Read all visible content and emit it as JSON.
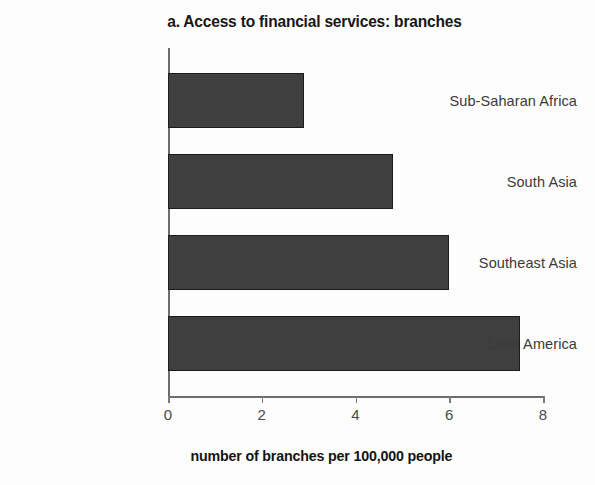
{
  "chart_data": {
    "type": "bar",
    "orientation": "horizontal",
    "title": "a. Access to financial services: branches",
    "xlabel": "number of branches per 100,000 people",
    "ylabel": "",
    "categories": [
      "Sub-Saharan Africa",
      "South Asia",
      "Southeast Asia",
      "Latin America"
    ],
    "values": [
      2.9,
      4.8,
      6.0,
      7.5
    ],
    "xlim": [
      0,
      8
    ],
    "xticks": [
      0,
      2,
      4,
      6,
      8
    ],
    "xtick_labels": [
      "0",
      "2",
      "4",
      "6",
      "8"
    ],
    "grid": false,
    "legend": false,
    "bar_color": "#3f3f3f",
    "bar_border_color": "#1c1c1c",
    "axis_color": "#6d6d6d",
    "background_color": "#fdfdfd"
  }
}
